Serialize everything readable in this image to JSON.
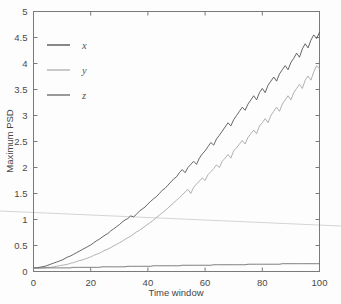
{
  "figure": {
    "background_color": "#fdfdfd",
    "frame_color": "#7a7a7a",
    "artifact": {
      "name": "scan-fold-line",
      "color": "#d0d0d0",
      "description": "faint diagonal gray line across full image width"
    }
  },
  "axes": {
    "x": {
      "label": "Time window",
      "ticks": [
        0,
        20,
        40,
        60,
        80,
        100
      ],
      "tick_labels": [
        "0",
        "20",
        "40",
        "60",
        "80",
        "100"
      ],
      "range": [
        0,
        100
      ]
    },
    "y": {
      "label": "Maximum PSD",
      "ticks": [
        0,
        0.5,
        1,
        1.5,
        2,
        2.5,
        3,
        3.5,
        4,
        4.5,
        5
      ],
      "tick_labels": [
        "0",
        "0.5",
        "1",
        "1.5",
        "2",
        "2.5",
        "3",
        "3.5",
        "4",
        "4.5",
        "5"
      ],
      "range": [
        0,
        5
      ]
    }
  },
  "legend": {
    "position": "top-left",
    "entries": [
      {
        "label": "x",
        "color": "#555555"
      },
      {
        "label": "y",
        "color": "#a8a8a8"
      },
      {
        "label": "z",
        "color": "#6e6e6e"
      }
    ]
  },
  "chart_data": {
    "type": "line",
    "title": "",
    "xlabel": "Time window",
    "ylabel": "Maximum PSD",
    "xlim": [
      0,
      100
    ],
    "ylim": [
      0,
      5
    ],
    "grid": false,
    "legend_position": "top-left",
    "x": [
      0,
      1,
      2,
      3,
      4,
      5,
      6,
      7,
      8,
      9,
      10,
      11,
      12,
      13,
      14,
      15,
      16,
      17,
      18,
      19,
      20,
      21,
      22,
      23,
      24,
      25,
      26,
      27,
      28,
      29,
      30,
      31,
      32,
      33,
      34,
      35,
      36,
      37,
      38,
      39,
      40,
      41,
      42,
      43,
      44,
      45,
      46,
      47,
      48,
      49,
      50,
      51,
      52,
      53,
      54,
      55,
      56,
      57,
      58,
      59,
      60,
      61,
      62,
      63,
      64,
      65,
      66,
      67,
      68,
      69,
      70,
      71,
      72,
      73,
      74,
      75,
      76,
      77,
      78,
      79,
      80,
      81,
      82,
      83,
      84,
      85,
      86,
      87,
      88,
      89,
      90,
      91,
      92,
      93,
      94,
      95,
      96,
      97,
      98,
      99,
      100
    ],
    "series": [
      {
        "name": "x",
        "color": "#555555",
        "values": [
          0.07,
          0.07,
          0.08,
          0.09,
          0.1,
          0.12,
          0.14,
          0.16,
          0.18,
          0.2,
          0.22,
          0.25,
          0.28,
          0.3,
          0.33,
          0.36,
          0.39,
          0.42,
          0.45,
          0.48,
          0.51,
          0.55,
          0.59,
          0.62,
          0.66,
          0.7,
          0.73,
          0.78,
          0.82,
          0.86,
          0.9,
          0.95,
          0.99,
          1.02,
          1.07,
          1.05,
          1.1,
          1.16,
          1.2,
          1.24,
          1.3,
          1.35,
          1.4,
          1.44,
          1.5,
          1.56,
          1.6,
          1.66,
          1.72,
          1.78,
          1.82,
          1.9,
          1.96,
          1.9,
          2.0,
          2.06,
          2.12,
          2.06,
          2.18,
          2.26,
          2.32,
          2.4,
          2.48,
          2.43,
          2.55,
          2.62,
          2.7,
          2.78,
          2.86,
          2.8,
          2.92,
          3.0,
          3.08,
          3.16,
          3.1,
          3.22,
          3.3,
          3.38,
          3.3,
          3.44,
          3.52,
          3.44,
          3.58,
          3.66,
          3.74,
          3.66,
          3.8,
          3.88,
          3.96,
          3.88,
          4.02,
          4.1,
          4.2,
          4.12,
          4.28,
          4.38,
          4.3,
          4.45,
          4.55,
          4.48,
          4.6
        ]
      },
      {
        "name": "y",
        "color": "#a8a8a8",
        "values": [
          0.06,
          0.06,
          0.06,
          0.07,
          0.07,
          0.08,
          0.08,
          0.09,
          0.1,
          0.11,
          0.12,
          0.13,
          0.14,
          0.16,
          0.17,
          0.19,
          0.21,
          0.22,
          0.24,
          0.26,
          0.28,
          0.31,
          0.33,
          0.35,
          0.38,
          0.41,
          0.43,
          0.46,
          0.49,
          0.52,
          0.55,
          0.58,
          0.62,
          0.65,
          0.68,
          0.72,
          0.76,
          0.79,
          0.83,
          0.87,
          0.91,
          0.95,
          0.99,
          1.04,
          1.08,
          1.13,
          1.17,
          1.22,
          1.27,
          1.32,
          1.37,
          1.42,
          1.47,
          1.53,
          1.58,
          1.5,
          1.62,
          1.68,
          1.74,
          1.8,
          1.75,
          1.86,
          1.92,
          1.98,
          2.05,
          2.0,
          2.12,
          2.18,
          2.25,
          2.18,
          2.32,
          2.38,
          2.45,
          2.52,
          2.45,
          2.58,
          2.65,
          2.72,
          2.65,
          2.8,
          2.86,
          2.94,
          2.86,
          3.0,
          3.08,
          3.16,
          3.08,
          3.22,
          3.3,
          3.38,
          3.3,
          3.44,
          3.52,
          3.6,
          3.52,
          3.68,
          3.76,
          3.68,
          3.84,
          3.96,
          3.9
        ]
      },
      {
        "name": "z",
        "color": "#6e6e6e",
        "values": [
          0.07,
          0.07,
          0.07,
          0.07,
          0.07,
          0.07,
          0.07,
          0.07,
          0.07,
          0.07,
          0.07,
          0.07,
          0.07,
          0.07,
          0.08,
          0.08,
          0.08,
          0.08,
          0.08,
          0.08,
          0.08,
          0.08,
          0.08,
          0.08,
          0.09,
          0.09,
          0.09,
          0.09,
          0.09,
          0.09,
          0.09,
          0.09,
          0.09,
          0.1,
          0.1,
          0.1,
          0.1,
          0.1,
          0.1,
          0.1,
          0.1,
          0.1,
          0.11,
          0.11,
          0.11,
          0.11,
          0.11,
          0.11,
          0.11,
          0.11,
          0.11,
          0.11,
          0.12,
          0.12,
          0.12,
          0.12,
          0.12,
          0.12,
          0.12,
          0.12,
          0.12,
          0.12,
          0.12,
          0.13,
          0.13,
          0.13,
          0.13,
          0.13,
          0.13,
          0.13,
          0.13,
          0.13,
          0.13,
          0.13,
          0.13,
          0.14,
          0.14,
          0.14,
          0.14,
          0.14,
          0.14,
          0.14,
          0.14,
          0.14,
          0.14,
          0.14,
          0.14,
          0.15,
          0.15,
          0.15,
          0.15,
          0.15,
          0.15,
          0.15,
          0.15,
          0.15,
          0.15,
          0.15,
          0.15,
          0.15,
          0.15
        ]
      }
    ]
  }
}
